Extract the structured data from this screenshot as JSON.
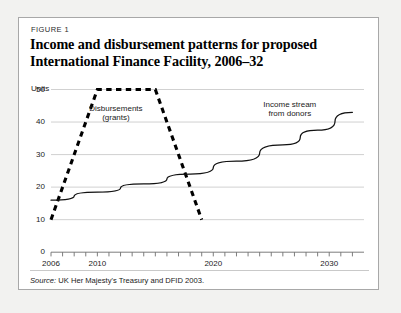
{
  "figure": {
    "label": "FIGURE 1",
    "title_line1": "Income and disbursement patterns for proposed",
    "title_line2": "International Finance Facility, 2006–32",
    "source_prefix": "Source:",
    "source_text": " UK Her Majesty's Treasury and DFID 2003."
  },
  "colors": {
    "page_background": "#f2f2f0",
    "card_background": "#ffffff",
    "card_border": "#a8a8a8",
    "gridline": "#c9c9c9",
    "axis": "#6e6e6e",
    "income_line": "#111111",
    "disbursement_line": "#000000",
    "text": "#1a1a1a"
  },
  "chart_data": {
    "type": "line",
    "title": "Income and disbursement patterns for proposed International Finance Facility, 2006–32",
    "xlabel": "",
    "ylabel": "Units",
    "ylim": [
      0,
      50
    ],
    "xlim": [
      2006,
      2033
    ],
    "grid": true,
    "legend_position": "inline-annotations",
    "yticks": [
      0,
      10,
      20,
      30,
      40,
      50
    ],
    "ytick_labels": [
      "0",
      "10",
      "20",
      "30",
      "40",
      "50"
    ],
    "xticks": [
      2006,
      2007,
      2008,
      2009,
      2010,
      2011,
      2012,
      2013,
      2014,
      2015,
      2016,
      2017,
      2018,
      2019,
      2020,
      2021,
      2022,
      2023,
      2024,
      2025,
      2026,
      2027,
      2028,
      2029,
      2030,
      2031,
      2032
    ],
    "xtick_labels_shown": [
      "2006",
      "2010",
      "2020",
      "2030"
    ],
    "xtick_label_values": [
      2006,
      2010,
      2020,
      2030
    ],
    "series": [
      {
        "name": "Disbursements (grants)",
        "style": "dashed",
        "x": [
          2006,
          2010,
          2015,
          2019
        ],
        "values": [
          10,
          50,
          50,
          10
        ],
        "annotation_line1": "Disbursements",
        "annotation_line2": "(grants)"
      },
      {
        "name": "Income stream from donors",
        "style": "solid",
        "x": [
          2006,
          2010,
          2014,
          2018,
          2022,
          2026,
          2029,
          2032
        ],
        "values": [
          16,
          18.5,
          21,
          24,
          28,
          33,
          37.5,
          43
        ],
        "annotation_line1": "Income stream",
        "annotation_line2": "from donors"
      }
    ]
  }
}
